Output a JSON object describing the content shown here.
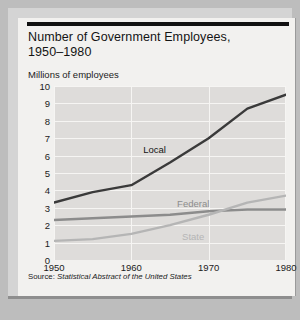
{
  "card": {
    "title_line1": "Number of Government Employees,",
    "title_line2": "1950–1980",
    "axis_unit_label": "Millions of employees",
    "source_prefix": "Source:",
    "source_title": "Statistical Abstract of the United States"
  },
  "colors": {
    "page_background": "#bdbdbd",
    "card_background": "#f2f1ef",
    "plot_background": "#dedcda",
    "gridline": "#f6f5f3",
    "top_rule": "#111111",
    "bottom_rule": "#8e8e8e",
    "local_series": "#3a3a3a",
    "federal_series": "#8c8c8c",
    "state_series": "#b5b5b5",
    "text": "#1b1b1b"
  },
  "chart_data": {
    "type": "line",
    "title": "Number of Government Employees, 1950–1980",
    "xlabel": "",
    "ylabel": "Millions of employees",
    "xlim": [
      1950,
      1980
    ],
    "ylim": [
      0,
      10
    ],
    "xticks": [
      1950,
      1960,
      1970,
      1980
    ],
    "yticks": [
      0,
      1,
      2,
      3,
      4,
      5,
      6,
      7,
      8,
      9,
      10
    ],
    "grid": true,
    "legend": "inline-labels",
    "x": [
      1950,
      1955,
      1960,
      1965,
      1970,
      1975,
      1980
    ],
    "series": [
      {
        "name": "Local",
        "color": "#3a3a3a",
        "label_x": 1963,
        "label_y": 6.4,
        "values": [
          3.3,
          3.9,
          4.3,
          5.6,
          7.0,
          8.7,
          9.5
        ]
      },
      {
        "name": "Federal",
        "color": "#8c8c8c",
        "label_x": 1968,
        "label_y": 3.3,
        "values": [
          2.3,
          2.4,
          2.5,
          2.6,
          2.8,
          2.9,
          2.9
        ]
      },
      {
        "name": "State",
        "color": "#b5b5b5",
        "label_x": 1968,
        "label_y": 1.4,
        "values": [
          1.1,
          1.2,
          1.5,
          2.0,
          2.6,
          3.3,
          3.7
        ]
      }
    ]
  }
}
